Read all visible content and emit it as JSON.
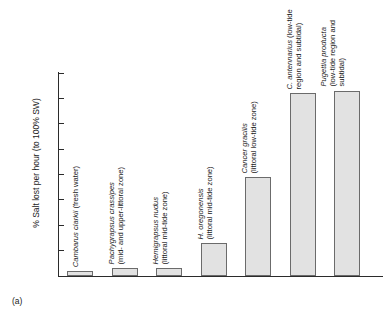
{
  "figure": {
    "panel_letter": "(a)"
  },
  "chart_data": {
    "type": "bar",
    "title": "",
    "xlabel": "",
    "ylabel": "% Salt lost per hour (to 100% SW)",
    "ylim": [
      0,
      0.8
    ],
    "ytick_labels": [
      "0.8",
      "0.7",
      "0.6",
      "0.5",
      "0.4",
      "0.3",
      "0.2",
      "0.1",
      "0"
    ],
    "ytick_values": [
      0.8,
      0.7,
      0.6,
      0.5,
      0.4,
      0.3,
      0.2,
      0.1,
      0
    ],
    "grid": false,
    "legend": "none",
    "categories": [
      "Cambarus clarkii (fresh water)",
      "Pachygrapsus crassipes (mid- and upper-littoral zone)",
      "Hemigrapsus nudus (littoral mid-tide zone)",
      "H. oregonensis (littoral mid-tide zone)",
      "Cancer gracilis (littoral low-tide zone)",
      "C. antennarius (low-tide region and subtidal)",
      "Pugettia producta (low-tide region and subtidal)"
    ],
    "values": [
      0.02,
      0.03,
      0.03,
      0.13,
      0.39,
      0.72,
      0.73
    ],
    "bars": [
      {
        "species": "Cambarus clarkii",
        "habitat": "(fresh water)",
        "label_lines": [
          "Cambarus clarkii (fresh water)"
        ],
        "value": 0.02
      },
      {
        "species": "Pachygrapsus crassipes",
        "habitat": "(mid- and upper-littoral zone)",
        "label_lines": [
          "Pachygrapsus crassipes",
          "(mid- and upper-littoral zone)"
        ],
        "value": 0.03
      },
      {
        "species": "Hemigrapsus nudus",
        "habitat": "(littoral mid-tide zone)",
        "label_lines": [
          "Hemigrapsus nudus",
          "(littoral mid-tide zone)"
        ],
        "value": 0.03
      },
      {
        "species": "H. oregonensis",
        "habitat": "(littoral mid-tide zone)",
        "label_lines": [
          "H. oregonensis",
          "(littoral mid-tide zone)"
        ],
        "value": 0.13
      },
      {
        "species": "Cancer gracilis",
        "habitat": "(littoral low-tide zone)",
        "label_lines": [
          "Cancer gracilis",
          "(littoral low-tide zone)"
        ],
        "value": 0.39
      },
      {
        "species": "C. antennarius",
        "habitat": "(low-tide region and subtidal)",
        "label_lines": [
          "C. antennarius (low-tide",
          "region and subtidal)"
        ],
        "value": 0.72
      },
      {
        "species": "Pugettia producta",
        "habitat": "(low-tide region and subtidal)",
        "label_lines": [
          "Pugettia producta",
          "(low-tide region and",
          "subtidal)"
        ],
        "value": 0.73
      }
    ],
    "colors": {
      "bar_fill": "#e2e2e2",
      "bar_stroke": "#6b6b6b",
      "axis": "#2b2b2b",
      "text": "#1a1a1a",
      "background": "#ffffff"
    }
  }
}
